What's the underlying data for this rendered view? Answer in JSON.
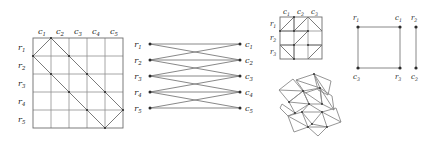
{
  "figure": {
    "caption": "",
    "panels": [
      {
        "id": "panel-grid-5x5",
        "name": "rook-placement-grid-5x5",
        "type": "grid-diagram",
        "rows": 5,
        "cols": 5,
        "row_labels": [
          "r1",
          "r2",
          "r3",
          "r4",
          "r5"
        ],
        "col_labels": [
          "c1",
          "c2",
          "c3",
          "c4",
          "c5"
        ],
        "row_label_parts": [
          {
            "base": "r",
            "sub": "1"
          },
          {
            "base": "r",
            "sub": "2"
          },
          {
            "base": "r",
            "sub": "3"
          },
          {
            "base": "r",
            "sub": "4"
          },
          {
            "base": "r",
            "sub": "5"
          }
        ],
        "col_label_parts": [
          {
            "base": "c",
            "sub": "1"
          },
          {
            "base": "c",
            "sub": "2"
          },
          {
            "base": "c",
            "sub": "3"
          },
          {
            "base": "c",
            "sub": "4"
          },
          {
            "base": "c",
            "sub": "5"
          }
        ]
      },
      {
        "id": "panel-bipartite",
        "name": "bipartite-graph",
        "type": "bipartite-graph",
        "left_labels": [
          "r1",
          "r2",
          "r3",
          "r4",
          "r5"
        ],
        "right_labels": [
          "c1",
          "c2",
          "c3",
          "c4",
          "c5"
        ],
        "left_label_parts": [
          {
            "base": "r",
            "sub": "1"
          },
          {
            "base": "r",
            "sub": "2"
          },
          {
            "base": "r",
            "sub": "3"
          },
          {
            "base": "r",
            "sub": "4"
          },
          {
            "base": "r",
            "sub": "5"
          }
        ],
        "right_label_parts": [
          {
            "base": "c",
            "sub": "1"
          },
          {
            "base": "c",
            "sub": "2"
          },
          {
            "base": "c",
            "sub": "3"
          },
          {
            "base": "c",
            "sub": "4"
          },
          {
            "base": "c",
            "sub": "5"
          }
        ],
        "edges": [
          {
            "from": "r1",
            "to": "c1"
          },
          {
            "from": "r1",
            "to": "c2"
          },
          {
            "from": "r2",
            "to": "c1"
          },
          {
            "from": "r2",
            "to": "c2"
          },
          {
            "from": "r2",
            "to": "c3"
          },
          {
            "from": "r3",
            "to": "c2"
          },
          {
            "from": "r3",
            "to": "c3"
          },
          {
            "from": "r3",
            "to": "c4"
          },
          {
            "from": "r4",
            "to": "c3"
          },
          {
            "from": "r4",
            "to": "c4"
          },
          {
            "from": "r4",
            "to": "c5"
          },
          {
            "from": "r5",
            "to": "c4"
          },
          {
            "from": "r5",
            "to": "c5"
          }
        ]
      },
      {
        "id": "panel-grid-3x3",
        "name": "rook-placement-grid-3x3",
        "type": "grid-diagram",
        "rows": 3,
        "cols": 3,
        "row_labels": [
          "r1",
          "r2",
          "r3"
        ],
        "col_labels": [
          "c1",
          "c2",
          "c3"
        ],
        "row_label_parts": [
          {
            "base": "r",
            "sub": "1"
          },
          {
            "base": "r",
            "sub": "2"
          },
          {
            "base": "r",
            "sub": "3"
          }
        ],
        "col_label_parts": [
          {
            "base": "c",
            "sub": "1"
          },
          {
            "base": "c",
            "sub": "2"
          },
          {
            "base": "c",
            "sub": "3"
          }
        ]
      },
      {
        "id": "panel-square-graph",
        "name": "square-and-edge-graph",
        "type": "node-link-graph",
        "nodes": [
          {
            "id": "r1",
            "label": "r1",
            "base": "r",
            "sub": "1",
            "position": "top-left"
          },
          {
            "id": "c1",
            "label": "c1",
            "base": "c",
            "sub": "1",
            "position": "top-right"
          },
          {
            "id": "r2",
            "label": "r2",
            "base": "r",
            "sub": "2",
            "position": "top-far-right"
          },
          {
            "id": "c3",
            "label": "c3",
            "base": "c",
            "sub": "3",
            "position": "bottom-left"
          },
          {
            "id": "r3",
            "label": "r3",
            "base": "r",
            "sub": "3",
            "position": "bottom-right"
          },
          {
            "id": "c2",
            "label": "c2",
            "base": "c",
            "sub": "2",
            "position": "bottom-far-right"
          }
        ],
        "edges": [
          {
            "from": "r1",
            "to": "c1"
          },
          {
            "from": "c1",
            "to": "r3"
          },
          {
            "from": "r3",
            "to": "c3"
          },
          {
            "from": "c3",
            "to": "r1"
          },
          {
            "from": "r2",
            "to": "c2"
          }
        ]
      },
      {
        "id": "panel-mesh",
        "name": "rotated-polygon-mesh",
        "type": "mesh-diagram",
        "description": "rotated quadrilateral mesh with triangulated cells"
      }
    ]
  }
}
